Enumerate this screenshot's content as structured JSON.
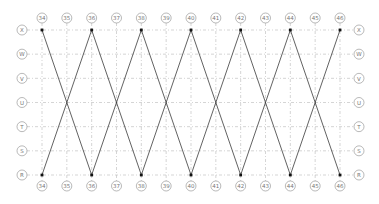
{
  "diagram": {
    "type": "structural-grid-bracing",
    "columns": [
      "34",
      "35",
      "36",
      "37",
      "38",
      "39",
      "40",
      "41",
      "42",
      "43",
      "44",
      "45",
      "46"
    ],
    "rows_top_to_bottom": [
      "X",
      "W",
      "V",
      "U",
      "T",
      "S",
      "R"
    ],
    "bracing": {
      "pattern": "X-bracing between top row and bottom row",
      "top_row": "X",
      "bottom_row": "R",
      "crossing_row": "U",
      "node_columns": [
        "34",
        "36",
        "38",
        "40",
        "42",
        "44",
        "46"
      ],
      "crossing_columns": [
        "35",
        "37",
        "39",
        "41",
        "43",
        "45"
      ]
    },
    "colors": {
      "grid": "#b9b9b9",
      "brace": "#3a3a3a",
      "node": "#111111",
      "label": "#777777"
    }
  }
}
